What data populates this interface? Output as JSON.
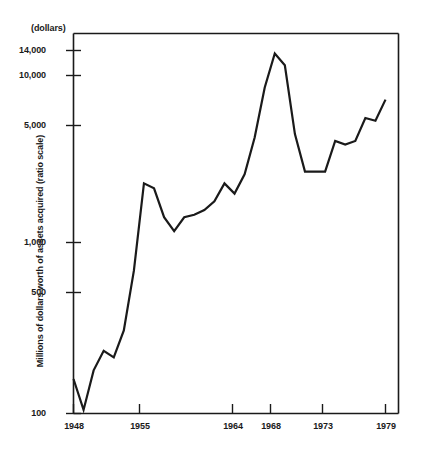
{
  "chart_data": {
    "type": "line",
    "title": "",
    "unit_note": "(dollars)",
    "xlabel": "",
    "ylabel": "Millions of dollars worth of assets acquired (ratio scale)",
    "scale": "log",
    "grid": false,
    "legend": "none",
    "ylim": [
      100,
      20000
    ],
    "xlim": [
      1948,
      1980
    ],
    "yticks": [
      {
        "value": 14000,
        "label": "14,000"
      },
      {
        "value": 10000,
        "label": "10,000"
      },
      {
        "value": 5000,
        "label": "5,000"
      },
      {
        "value": 1000,
        "label": "1,000"
      },
      {
        "value": 500,
        "label": "500"
      },
      {
        "value": 100,
        "label": "100"
      }
    ],
    "xticks": [
      {
        "value": 1948,
        "label": "1948"
      },
      {
        "value": 1955,
        "label": "1955"
      },
      {
        "value": 1964,
        "label": "1964"
      },
      {
        "value": 1968,
        "label": "1968"
      },
      {
        "value": 1973,
        "label": "1973"
      },
      {
        "value": 1979,
        "label": "1979"
      }
    ],
    "series": [
      {
        "name": "Assets acquired",
        "color": "#1a1a1a",
        "x": [
          1948,
          1949,
          1950,
          1951,
          1952,
          1953,
          1954,
          1955,
          1956,
          1957,
          1958,
          1959,
          1960,
          1961,
          1962,
          1963,
          1964,
          1965,
          1966,
          1967,
          1968,
          1969,
          1970,
          1971,
          1972,
          1973,
          1974,
          1975,
          1976,
          1977,
          1978,
          1979
        ],
        "y": [
          160,
          105,
          180,
          235,
          215,
          310,
          700,
          2300,
          2150,
          1450,
          1200,
          1450,
          1500,
          1600,
          1800,
          2300,
          2000,
          2600,
          4300,
          8500,
          13500,
          11500,
          4500,
          2700,
          2700,
          2700,
          4100,
          3900,
          4100,
          5600,
          5400,
          7200
        ]
      }
    ]
  }
}
